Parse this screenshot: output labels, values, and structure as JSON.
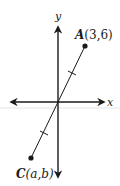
{
  "diagram": {
    "type": "coordinate-plane",
    "axes": {
      "x_label": "x",
      "y_label": "y"
    },
    "points": [
      {
        "name": "A",
        "coords": "(3,6)",
        "label_name": "A",
        "label_coords": "(3,6)"
      },
      {
        "name": "C",
        "coords": "(a,b)",
        "label_name": "C",
        "label_coords": "(a,b)"
      }
    ],
    "segment": {
      "from": "C",
      "to": "A",
      "passes_through": "origin",
      "tick_marks": 2,
      "note": "origin is the midpoint of segment AC (equal tick marks)"
    },
    "colors": {
      "ink": "#1a1a1a",
      "background": "#ffffff",
      "artifact_line": "#e6e6e6"
    }
  }
}
